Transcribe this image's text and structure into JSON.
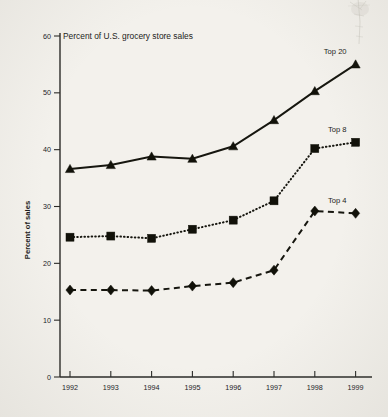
{
  "chart_data": {
    "type": "line",
    "title": "Percent of U.S. grocery store sales",
    "xlabel": "",
    "ylabel": "Percent of sales",
    "categories": [
      "1992",
      "1993",
      "1994",
      "1995",
      "1996",
      "1997",
      "1998",
      "1999"
    ],
    "x": [
      1992,
      1993,
      1994,
      1995,
      1996,
      1997,
      1998,
      1999
    ],
    "ylim": [
      0,
      60
    ],
    "yticks": [
      0,
      10,
      20,
      30,
      40,
      50,
      60
    ],
    "ytick_labels": [
      "0",
      "10",
      "20",
      "30",
      "40",
      "50",
      "60"
    ],
    "xtick_labels": [
      "1992",
      "1993",
      "1994",
      "1995",
      "1996",
      "1997",
      "1998",
      "1999"
    ],
    "grid": false,
    "legend_position": "inline-end-labels",
    "series": [
      {
        "name": "Top 20",
        "marker": "triangle",
        "linestyle": "solid",
        "color": "#16160f",
        "values": [
          36.6,
          37.3,
          38.8,
          38.4,
          40.6,
          45.2,
          50.3,
          55.0
        ]
      },
      {
        "name": "Top 8",
        "marker": "square",
        "linestyle": "dotted",
        "color": "#16160f",
        "values": [
          24.6,
          24.8,
          24.4,
          26.0,
          27.6,
          31.0,
          40.2,
          41.3
        ]
      },
      {
        "name": "Top 4",
        "marker": "diamond",
        "linestyle": "dashed",
        "color": "#16160f",
        "values": [
          15.3,
          15.3,
          15.2,
          16.0,
          16.6,
          18.8,
          29.2,
          28.8
        ]
      }
    ],
    "annotations": [
      {
        "text": "Top 20",
        "series": "Top 20",
        "at_x": 1999
      },
      {
        "text": "Top 8",
        "series": "Top 8",
        "at_x": 1999
      },
      {
        "text": "Top 4",
        "series": "Top 4",
        "at_x": 1999
      }
    ]
  },
  "layout": {
    "plot_left": 60,
    "plot_right": 366,
    "plot_top": 36,
    "plot_bottom": 377,
    "x_first": 70,
    "x_step": 40.8,
    "background": "#f3f1ec",
    "ink": "#16160f"
  }
}
